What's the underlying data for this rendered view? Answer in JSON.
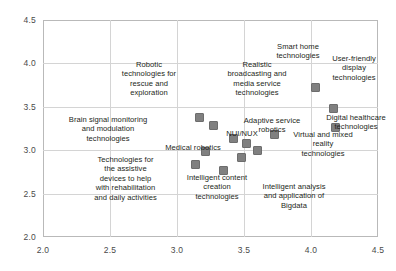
{
  "chart_data": {
    "type": "scatter",
    "title": "",
    "xlabel": "",
    "ylabel": "",
    "xlim": [
      2.0,
      4.5
    ],
    "ylim": [
      2.0,
      4.5
    ],
    "grid": true,
    "legend": "none",
    "xticks": [
      "2.0",
      "2.5",
      "3.0",
      "3.5",
      "4.0",
      "4.5"
    ],
    "yticks": [
      "2.0",
      "2.5",
      "3.0",
      "3.5",
      "4.0",
      "4.5"
    ],
    "marker_color": "#808080",
    "marker_edge_color": "#6d6d6d",
    "grid_color": "#d4d4d4",
    "axis_color": "#b9b9b9",
    "points": [
      {
        "label": "Robotic\ntechnologies for\nrescue and\nexploration",
        "x": 3.17,
        "y": 3.38
      },
      {
        "label": "Brain signal monitoring\nand modulation\ntechnologies",
        "x": 3.27,
        "y": 3.29
      },
      {
        "label": "Technologies for\nthe assistive\ndevices to help\nwith rehabilitation\nand daily activities",
        "x": 3.14,
        "y": 2.83
      },
      {
        "label": "Medical robotics",
        "x": 3.21,
        "y": 2.99
      },
      {
        "label": "Intelligent content\ncreation\ntechnologies",
        "x": 3.35,
        "y": 2.77
      },
      {
        "label": "NUI/NUX",
        "x": 3.42,
        "y": 3.13
      },
      {
        "label": "Realistic\nbroadcasting and\nmedia service\ntechnologies",
        "x": 3.52,
        "y": 3.08
      },
      {
        "label": "Adaptive service\nrobotics",
        "x": 3.6,
        "y": 3.0
      },
      {
        "label": "Intelligent analysis\nand application of\nBigdata",
        "x": 3.48,
        "y": 2.92
      },
      {
        "label": "Virtual and mixed\nreality\ntechnologies",
        "x": 3.73,
        "y": 3.18
      },
      {
        "label": "Smart home\ntechnologies",
        "x": 4.03,
        "y": 3.72
      },
      {
        "label": "User-friendly\ndisplay\ntechnologies",
        "x": 4.17,
        "y": 3.48
      },
      {
        "label": "Digital healthcare\ntechnologies",
        "x": 4.18,
        "y": 3.26
      }
    ]
  },
  "labels_layout": [
    {
      "name": "robotic-rescue",
      "text": "Robotic\ntechnologies for\nrescue and\nexploration",
      "left": 108,
      "top": 60,
      "width": 82
    },
    {
      "name": "brain-signal",
      "text": "Brain signal monitoring\nand modulation\ntechnologies",
      "left": 57,
      "top": 115,
      "width": 102
    },
    {
      "name": "assistive-devices",
      "text": "Technologies for\nthe assistive\ndevices to help\nwith rehabilitation\nand daily activities",
      "left": 79,
      "top": 155,
      "width": 93
    },
    {
      "name": "medical-robotics",
      "text": "Medical robotics",
      "left": 160,
      "top": 143,
      "width": 66
    },
    {
      "name": "intelligent-content",
      "text": "Intelligent content\ncreation\ntechnologies",
      "left": 177,
      "top": 173,
      "width": 80
    },
    {
      "name": "nui-nux",
      "text": "NUI/NUX",
      "left": 222,
      "top": 129,
      "width": 40
    },
    {
      "name": "realistic-broadcast",
      "text": "Realistic\nbroadcasting and\nmedia service\ntechnologies",
      "left": 215,
      "top": 60,
      "width": 84
    },
    {
      "name": "adaptive-robotics",
      "text": "Adaptive service\nrobotics",
      "left": 235,
      "top": 116,
      "width": 74
    },
    {
      "name": "bigdata-analysis",
      "text": "Intelligent analysis\nand application of\nBigdata",
      "left": 252,
      "top": 182,
      "width": 84
    },
    {
      "name": "virtual-mixed",
      "text": "Virtual and mixed\nreality\ntechnologies",
      "left": 284,
      "top": 130,
      "width": 78
    },
    {
      "name": "smart-home",
      "text": "Smart home\ntechnologies",
      "left": 267,
      "top": 42,
      "width": 62
    },
    {
      "name": "user-friendly",
      "text": "User-friendly\ndisplay\ntechnologies",
      "left": 322,
      "top": 54,
      "width": 64
    },
    {
      "name": "digital-healthcare",
      "text": "Digital healthcare\ntechnologies",
      "left": 318,
      "top": 113,
      "width": 76
    }
  ]
}
